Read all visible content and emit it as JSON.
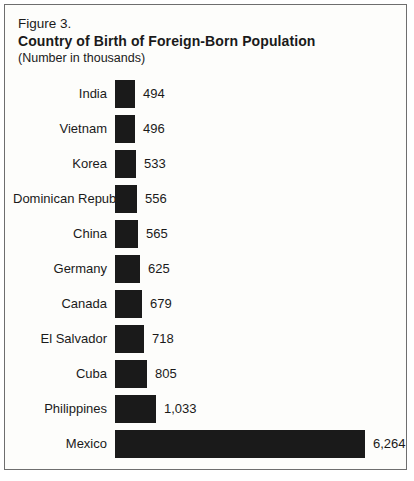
{
  "figure": {
    "label": "Figure 3.",
    "title": "Country of Birth of Foreign-Born Population",
    "subtitle": "(Number in thousands)"
  },
  "chart_data": {
    "type": "bar",
    "orientation": "horizontal",
    "title": "Country of Birth of Foreign-Born Population",
    "subtitle": "(Number in thousands)",
    "xlabel": "",
    "ylabel": "",
    "categories": [
      "India",
      "Vietnam",
      "Korea",
      "Dominican Republic",
      "China",
      "Germany",
      "Canada",
      "El Salvador",
      "Cuba",
      "Philippines",
      "Mexico"
    ],
    "values": [
      494,
      496,
      533,
      556,
      565,
      625,
      679,
      718,
      805,
      1033,
      6264
    ],
    "value_labels": [
      "494",
      "496",
      "533",
      "556",
      "565",
      "625",
      "679",
      "718",
      "805",
      "1,033",
      "6,264"
    ],
    "xlim": [
      0,
      6264
    ],
    "grid": false,
    "legend": false,
    "bar_color": "#1a1a1a",
    "max_bar_px": 250
  },
  "colors": {
    "border": "#6e6e6e",
    "background": "#fdfdfb",
    "text": "#1a1a1a"
  }
}
